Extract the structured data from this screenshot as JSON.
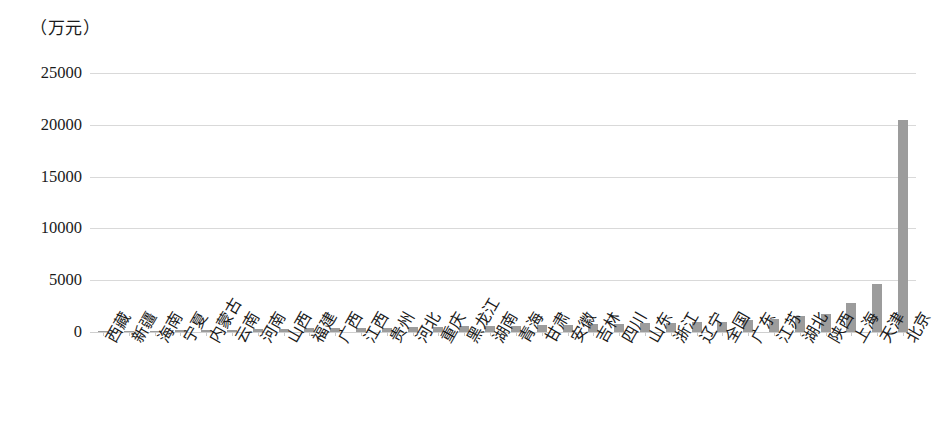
{
  "chart_data": {
    "type": "bar",
    "title": "",
    "subtitle": "",
    "unit_label": "（万元）",
    "xlabel": "",
    "ylabel": "",
    "ylim": [
      0,
      25000
    ],
    "ytick_labels": [
      "0",
      "5000",
      "10000",
      "15000",
      "20000",
      "25000"
    ],
    "ytick_values": [
      0,
      5000,
      10000,
      15000,
      20000,
      25000
    ],
    "grid": true,
    "legend": "none",
    "bar_color": "#9c9c9c",
    "gridline_color": "#d9d9d9",
    "categories": [
      "西藏",
      "新疆",
      "海南",
      "宁夏",
      "内蒙古",
      "云南",
      "河南",
      "山西",
      "福建",
      "广西",
      "江西",
      "贵州",
      "河北",
      "重庆",
      "黑龙江",
      "湖南",
      "青海",
      "甘肃",
      "安徽",
      "吉林",
      "四川",
      "山东",
      "浙江",
      "辽宁",
      "全国",
      "广东",
      "江苏",
      "湖北",
      "陕西",
      "上海",
      "天津",
      "北京"
    ],
    "values": [
      60,
      90,
      120,
      150,
      200,
      240,
      280,
      310,
      340,
      370,
      400,
      430,
      470,
      500,
      540,
      580,
      620,
      660,
      700,
      740,
      780,
      830,
      880,
      930,
      1000,
      1150,
      1300,
      1500,
      1750,
      2800,
      4600,
      20450
    ]
  }
}
